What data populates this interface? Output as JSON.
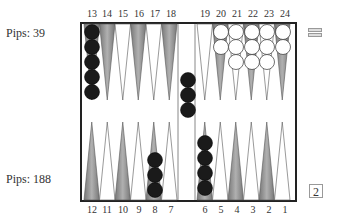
{
  "top_player": {
    "pips_label": "Pips:  39"
  },
  "bottom_player": {
    "pips_label": "Pips: 188"
  },
  "top_numbers": [
    "13",
    "14",
    "15",
    "16",
    "17",
    "18",
    "19",
    "20",
    "21",
    "22",
    "23",
    "24"
  ],
  "bottom_numbers": [
    "12",
    "11",
    "10",
    "9",
    "8",
    "7",
    "6",
    "5",
    "4",
    "3",
    "2",
    "1"
  ],
  "cube_value": "2",
  "menu_icon": "hamburger-icon",
  "colors": {
    "dark_checker": "#1a1a1a",
    "light_checker": "#ffffff",
    "shaded_point": "#9a9a9a",
    "board_border": "#222222"
  },
  "position": {
    "point_13": {
      "color": "black",
      "count": 5
    },
    "point_19": {
      "color": "white",
      "count": 0
    },
    "point_20": {
      "color": "white",
      "count": 2
    },
    "point_21": {
      "color": "white",
      "count": 3
    },
    "point_22": {
      "color": "white",
      "count": 3
    },
    "point_23": {
      "color": "white",
      "count": 3
    },
    "point_24": {
      "color": "white",
      "count": 2
    },
    "bar_black": 3,
    "point_8": {
      "color": "black",
      "count": 3
    },
    "point_6": {
      "color": "black",
      "count": 4
    }
  }
}
